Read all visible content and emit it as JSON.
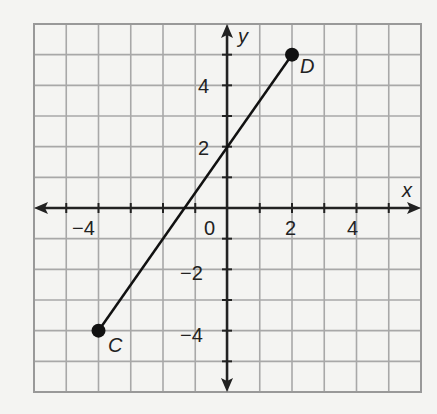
{
  "chart_data": {
    "type": "line",
    "title": "",
    "xlabel": "x",
    "ylabel": "y",
    "xlim": [
      -6,
      6
    ],
    "ylim": [
      -6,
      6
    ],
    "grid": true,
    "x_tick_labels": [
      "-4",
      "0",
      "2",
      "4"
    ],
    "y_tick_labels": [
      "4",
      "2",
      "-2",
      "-4"
    ],
    "series": [
      {
        "name": "segment CD",
        "points": [
          {
            "label": "C",
            "x": -4,
            "y": -4
          },
          {
            "label": "D",
            "x": 2,
            "y": 5
          }
        ]
      }
    ],
    "annotations": [
      {
        "text": "C",
        "x": -4,
        "y": -4
      },
      {
        "text": "D",
        "x": 2,
        "y": 5
      }
    ]
  },
  "labels": {
    "x_axis": "x",
    "y_axis": "y",
    "origin": "0",
    "point_c": "C",
    "point_d": "D",
    "xt_m4": "−4",
    "xt_2": "2",
    "xt_4": "4",
    "yt_4": "4",
    "yt_2": "2",
    "yt_m2": "−2",
    "yt_m4": "−4"
  }
}
